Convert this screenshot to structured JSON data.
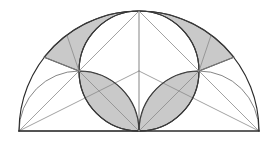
{
  "figure": {
    "title": "Semicircular geometric construction with shaded lens regions",
    "background_color": "#ffffff",
    "shade_color": "#c9c9c9",
    "line_color_dark": "#2b2b2b",
    "line_color_light": "#8a8a8a",
    "canvas": {
      "width": 278,
      "height": 141
    }
  },
  "chart_data": {
    "type": "diagram",
    "xlabel": "",
    "ylabel": "",
    "geometry": {
      "baseline_y": 131,
      "center": {
        "x": 139,
        "y": 131
      },
      "outer_radius": 120,
      "inner_radius": 60,
      "apex": {
        "x": 139,
        "y": 11
      },
      "left_end": {
        "x": 19,
        "y": 131
      },
      "right_end": {
        "x": 259,
        "y": 131
      },
      "node_left": {
        "x": 79,
        "y": 71
      },
      "node_right": {
        "x": 199,
        "y": 71
      },
      "node_left_base": {
        "x": 79,
        "y": 131
      },
      "node_right_base": {
        "x": 199,
        "y": 131
      }
    },
    "circles": [
      {
        "name": "outer-semicircle",
        "cx": 139,
        "cy": 131,
        "r": 120,
        "arc": "upper-half"
      },
      {
        "name": "left-semicircle",
        "cx": 79,
        "cy": 131,
        "r": 60,
        "arc": "upper-half"
      },
      {
        "name": "right-semicircle",
        "cx": 199,
        "cy": 131,
        "r": 60,
        "arc": "upper-half"
      },
      {
        "name": "center-circle",
        "cx": 139,
        "cy": 71,
        "r": 60,
        "arc": "full"
      }
    ],
    "shaded_regions": [
      "upper-left-lens",
      "upper-right-lens",
      "lower-left-petal",
      "lower-right-petal"
    ],
    "unshaded_regions": [
      "central-astroid",
      "outer-left-wedge",
      "outer-right-wedge",
      "left-foot-region",
      "right-foot-region"
    ],
    "straight_lines": [
      {
        "from": "left_end",
        "to": "right_end",
        "name": "baseline"
      },
      {
        "from": "apex",
        "to": "center",
        "name": "vertical-axis"
      },
      {
        "from": "left_end",
        "to": "node_left",
        "name": "left-lower-chord"
      },
      {
        "from": "node_left",
        "to": "apex",
        "name": "left-upper-chord"
      },
      {
        "from": "right_end",
        "to": "node_right",
        "name": "right-lower-chord"
      },
      {
        "from": "node_right",
        "to": "apex",
        "name": "right-upper-chord"
      },
      {
        "from": "left_end",
        "to": "center",
        "name": "left-base-chord"
      },
      {
        "from": "right_end",
        "to": "center",
        "name": "right-base-chord"
      },
      {
        "from": "node_left",
        "to": "center",
        "name": "left-inner-chord"
      },
      {
        "from": "node_right",
        "to": "center",
        "name": "right-inner-chord"
      }
    ]
  }
}
